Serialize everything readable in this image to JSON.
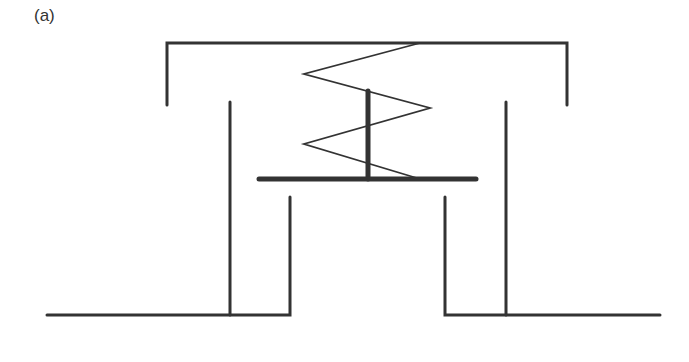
{
  "figure": {
    "panel_label": "(a)",
    "colors": {
      "stroke": "#333333",
      "background": "#ffffff"
    },
    "components": [
      {
        "name": "top-cap",
        "shape": "bracket",
        "points": [
          [
            167,
            105
          ],
          [
            167,
            43
          ],
          [
            567,
            43
          ],
          [
            567,
            105
          ]
        ]
      },
      {
        "name": "left-outer-wall",
        "shape": "line",
        "points": [
          [
            230,
            102
          ],
          [
            230,
            315
          ]
        ]
      },
      {
        "name": "right-outer-wall",
        "shape": "line",
        "points": [
          [
            506,
            102
          ],
          [
            506,
            315
          ]
        ]
      },
      {
        "name": "spring",
        "shape": "zigzag",
        "points": [
          [
            420,
            43
          ],
          [
            304,
            74
          ],
          [
            430,
            108
          ],
          [
            304,
            144
          ],
          [
            420,
            179
          ]
        ]
      },
      {
        "name": "valve-stem",
        "shape": "line",
        "points": [
          [
            368,
            91
          ],
          [
            368,
            179
          ]
        ]
      },
      {
        "name": "valve-plate",
        "shape": "line",
        "points": [
          [
            259,
            179
          ],
          [
            476,
            179
          ]
        ]
      },
      {
        "name": "left-base",
        "shape": "polyline",
        "points": [
          [
            47,
            315
          ],
          [
            290,
            315
          ],
          [
            290,
            197
          ]
        ]
      },
      {
        "name": "right-base",
        "shape": "polyline",
        "points": [
          [
            445,
            197
          ],
          [
            445,
            315
          ],
          [
            660,
            315
          ]
        ]
      }
    ]
  }
}
